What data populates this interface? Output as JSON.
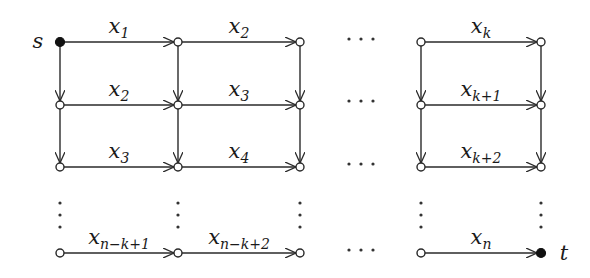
{
  "diagram": {
    "type": "grid-graph",
    "source_label": "s",
    "sink_label": "t",
    "columns_x": [
      60,
      178,
      300,
      421,
      541
    ],
    "rows_y": [
      42,
      105,
      167,
      253
    ],
    "horizontal_edges": [
      {
        "row": 0,
        "from_col": 0,
        "to_col": 1,
        "label": "x",
        "sub": "1"
      },
      {
        "row": 0,
        "from_col": 1,
        "to_col": 2,
        "label": "x",
        "sub": "2"
      },
      {
        "row": 0,
        "from_col": 3,
        "to_col": 4,
        "label": "x",
        "sub": "k"
      },
      {
        "row": 1,
        "from_col": 0,
        "to_col": 1,
        "label": "x",
        "sub": "2"
      },
      {
        "row": 1,
        "from_col": 1,
        "to_col": 2,
        "label": "x",
        "sub": "3"
      },
      {
        "row": 1,
        "from_col": 3,
        "to_col": 4,
        "label": "x",
        "sub": "k+1"
      },
      {
        "row": 2,
        "from_col": 0,
        "to_col": 1,
        "label": "x",
        "sub": "3"
      },
      {
        "row": 2,
        "from_col": 1,
        "to_col": 2,
        "label": "x",
        "sub": "4"
      },
      {
        "row": 2,
        "from_col": 3,
        "to_col": 4,
        "label": "x",
        "sub": "k+2"
      },
      {
        "row": 3,
        "from_col": 0,
        "to_col": 1,
        "label": "x",
        "sub": "n−k+1"
      },
      {
        "row": 3,
        "from_col": 1,
        "to_col": 2,
        "label": "x",
        "sub": "n−k+2"
      },
      {
        "row": 3,
        "from_col": 3,
        "to_col": 4,
        "label": "x",
        "sub": "n"
      }
    ],
    "vertical_edges_rows": [
      [
        0,
        1
      ],
      [
        1,
        2
      ]
    ],
    "ellipsis_horizontal": "· · ·",
    "ellipsis_vertical": "⋮"
  }
}
